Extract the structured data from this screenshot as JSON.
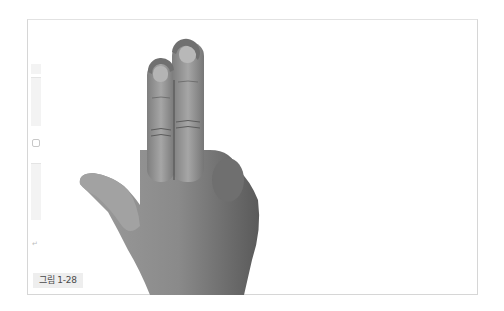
{
  "figure": {
    "caption": "그림 1-28",
    "touch_points": [
      {
        "label": "touch-point-index",
        "cx": 161,
        "cy": 71,
        "r": 13
      },
      {
        "label": "touch-point-middle",
        "cx": 186,
        "cy": 50,
        "r": 14
      }
    ],
    "colors": {
      "frame_border": "#d6d6d6",
      "touch_ring": "#707070",
      "skin_light": "#9a9a9a",
      "skin_dark": "#5e5e5e",
      "caption_bg": "#eeeeee",
      "caption_text": "#4a4a4a"
    }
  },
  "device_edge": {
    "back_glyph": "↵"
  }
}
